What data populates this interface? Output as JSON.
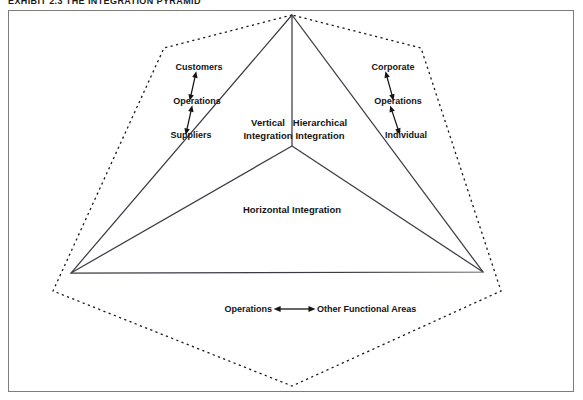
{
  "exhibit": {
    "title": "EXHIBIT 2.3   THE INTEGRATION PYRAMID"
  },
  "colors": {
    "frame_border": "#7d7d7d",
    "solid_line": "#3c3c44",
    "dashed_line": "#1a1a1a",
    "text": "#141414",
    "background": "#ffffff"
  },
  "diagram": {
    "name": "integration-pyramid",
    "apex_label": "",
    "center_labels": [
      {
        "id": "vertical",
        "text_line1": "Vertical",
        "text_line2": "Integration",
        "x": 268,
        "y": 118
      },
      {
        "id": "hierarchical",
        "text_line1": "Hierarchical",
        "text_line2": "Integration",
        "x": 314,
        "y": 118
      }
    ],
    "horizontal_label": {
      "id": "horizontal",
      "text": "Horizontal Integration",
      "x": 291,
      "y": 208
    },
    "left_chain": {
      "id": "vertical-integration-chain",
      "items": [
        {
          "text": "Customers",
          "x": 196,
          "y": 64
        },
        {
          "text": "Operations",
          "x": 196,
          "y": 97
        },
        {
          "text": "Suppliers",
          "x": 191,
          "y": 131
        }
      ],
      "arrows": [
        {
          "x1": 190,
          "y1": 72,
          "x2": 196,
          "y2": 88
        },
        {
          "x1": 190,
          "y1": 105,
          "x2": 196,
          "y2": 122
        }
      ]
    },
    "right_chain": {
      "id": "hierarchical-integration-chain",
      "items": [
        {
          "text": "Corporate",
          "x": 400,
          "y": 64
        },
        {
          "text": "Operations",
          "x": 400,
          "y": 97
        },
        {
          "text": "Individual",
          "x": 404,
          "y": 131
        }
      ],
      "arrows": [
        {
          "x1": 392,
          "y1": 72,
          "x2": 400,
          "y2": 88
        },
        {
          "x1": 392,
          "y1": 105,
          "x2": 400,
          "y2": 122
        }
      ]
    },
    "bottom_relation": {
      "id": "operations-functional-areas",
      "left_text": "Operations",
      "right_text": "Other Functional Areas",
      "left_x": 250,
      "right_x": 334,
      "y": 305,
      "arrow": {
        "x1": 260,
        "y1": 302,
        "x2": 294,
        "y2": 302
      }
    },
    "geometry": {
      "apex": {
        "x": 291,
        "y": 14
      },
      "left_vertex": {
        "x": 70,
        "y": 272
      },
      "right_vertex": {
        "x": 482,
        "y": 271
      },
      "center_junction": {
        "x": 291,
        "y": 145
      },
      "hex_top_left": {
        "x": 163,
        "y": 47
      },
      "hex_top_right": {
        "x": 420,
        "y": 47
      },
      "hex_bottom_left": {
        "x": 52,
        "y": 290
      },
      "hex_bottom_right": {
        "x": 500,
        "y": 290
      },
      "hex_bottom": {
        "x": 291,
        "y": 385
      }
    }
  }
}
